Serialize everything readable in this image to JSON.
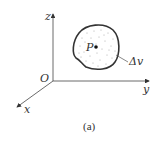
{
  "figure": {
    "caption": "(a)",
    "axes": {
      "origin_label": "O",
      "x_label": "x",
      "y_label": "y",
      "z_label": "z"
    },
    "region": {
      "point_label": "P",
      "volume_label": "Δv"
    },
    "colors": {
      "stroke": "#333333",
      "stipple": "#9a9a9a",
      "background": "#ffffff"
    }
  }
}
